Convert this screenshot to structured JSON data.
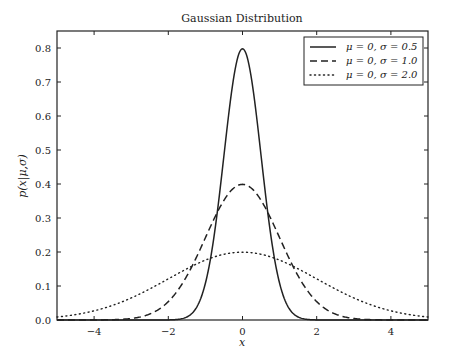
{
  "chart_data": {
    "type": "line",
    "title": "Gaussian Distribution",
    "xlabel": "x",
    "ylabel": "p(x|μ,σ)",
    "xlim": [
      -5,
      5
    ],
    "ylim": [
      0,
      0.85
    ],
    "xticks": [
      -4,
      -2,
      0,
      2,
      4
    ],
    "xtick_labels": [
      "−4",
      "−2",
      "0",
      "2",
      "4"
    ],
    "yticks": [
      0.0,
      0.1,
      0.2,
      0.3,
      0.4,
      0.5,
      0.6,
      0.7,
      0.8
    ],
    "ytick_labels": [
      "0.0",
      "0.1",
      "0.2",
      "0.3",
      "0.4",
      "0.5",
      "0.6",
      "0.7",
      "0.8"
    ],
    "grid": false,
    "legend_position": "upper right",
    "series": [
      {
        "name": "μ = 0, σ = 0.5",
        "mu": 0,
        "sigma": 0.5,
        "style": "solid",
        "peak": 0.798
      },
      {
        "name": "μ = 0, σ = 1.0",
        "mu": 0,
        "sigma": 1.0,
        "style": "dashed",
        "peak": 0.399
      },
      {
        "name": "μ = 0, σ = 2.0",
        "mu": 0,
        "sigma": 2.0,
        "style": "dotted",
        "peak": 0.199
      }
    ]
  }
}
